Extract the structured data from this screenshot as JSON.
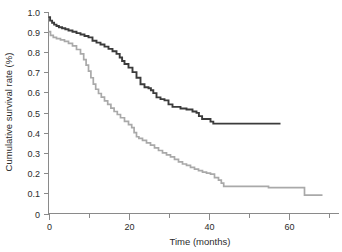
{
  "chart_data": {
    "type": "line",
    "title": "",
    "subtitle": "",
    "xlabel": "Time (months)",
    "ylabel": "Cumulative survival rate (%)",
    "xlim": [
      0,
      72.5
    ],
    "ylim": [
      0,
      1.0
    ],
    "grid": false,
    "legend": "none",
    "xticks": [
      0,
      20,
      40,
      60
    ],
    "xtick_labels": [
      "0",
      "20",
      "40",
      "60"
    ],
    "xminor_ticks": [
      10,
      30,
      50,
      70
    ],
    "yticks": [
      0,
      0.1,
      0.2,
      0.3,
      0.4,
      0.5,
      0.6,
      0.7,
      0.8,
      0.9,
      1.0
    ],
    "ytick_labels": [
      "0",
      "0.1",
      "0.2",
      "0.3",
      "0.4",
      "0.5",
      "0.6",
      "0.7",
      "0.8",
      "0.9",
      "1.0"
    ],
    "annotations": [],
    "series": [
      {
        "name": "upper-curve",
        "style": "step-post",
        "color": "#3b3b3b",
        "width": 1.9,
        "x": [
          0,
          0.4,
          0.9,
          1.4,
          2.0,
          2.6,
          3.4,
          4.2,
          5.0,
          6.0,
          7.0,
          8.0,
          9.0,
          10.0,
          11.0,
          12.0,
          13.0,
          14.0,
          15.0,
          16.0,
          17.0,
          17.8,
          18.4,
          19.0,
          20.0,
          21.0,
          22.0,
          23.0,
          24.0,
          25.0,
          25.6,
          26.2,
          27.0,
          28.0,
          29.0,
          30.0,
          31.0,
          33.0,
          34.5,
          36.0,
          37.0,
          37.6,
          38.4,
          40.5,
          41.2,
          58.0
        ],
        "y": [
          0.972,
          0.955,
          0.944,
          0.935,
          0.928,
          0.922,
          0.917,
          0.912,
          0.906,
          0.9,
          0.893,
          0.886,
          0.879,
          0.872,
          0.855,
          0.846,
          0.837,
          0.826,
          0.815,
          0.803,
          0.79,
          0.772,
          0.755,
          0.74,
          0.722,
          0.7,
          0.672,
          0.64,
          0.625,
          0.62,
          0.61,
          0.596,
          0.575,
          0.566,
          0.56,
          0.54,
          0.528,
          0.52,
          0.515,
          0.505,
          0.498,
          0.482,
          0.468,
          0.455,
          0.445,
          0.445
        ]
      },
      {
        "name": "lower-curve",
        "style": "step-post",
        "color": "#a9a9a9",
        "width": 1.7,
        "x": [
          0,
          0.5,
          1.2,
          2.0,
          3.0,
          4.0,
          5.0,
          6.0,
          7.0,
          8.0,
          8.8,
          9.4,
          10.0,
          10.6,
          11.2,
          11.8,
          12.5,
          13.2,
          14.0,
          14.8,
          15.6,
          16.4,
          17.2,
          18.0,
          19.0,
          20.0,
          20.8,
          21.4,
          22.0,
          22.6,
          23.5,
          24.5,
          25.5,
          26.5,
          27.5,
          28.5,
          29.5,
          30.5,
          31.5,
          32.5,
          33.5,
          34.5,
          35.5,
          36.5,
          37.5,
          38.5,
          39.5,
          40.5,
          41.5,
          42.5,
          43.2,
          43.8,
          54.0,
          55.0,
          63.0,
          64.0,
          68.5
        ],
        "y": [
          0.9,
          0.882,
          0.872,
          0.866,
          0.86,
          0.852,
          0.842,
          0.83,
          0.812,
          0.79,
          0.762,
          0.735,
          0.705,
          0.672,
          0.64,
          0.615,
          0.594,
          0.576,
          0.558,
          0.54,
          0.522,
          0.505,
          0.49,
          0.474,
          0.456,
          0.44,
          0.425,
          0.4,
          0.38,
          0.372,
          0.362,
          0.35,
          0.338,
          0.325,
          0.312,
          0.3,
          0.29,
          0.28,
          0.268,
          0.256,
          0.245,
          0.238,
          0.228,
          0.22,
          0.212,
          0.205,
          0.2,
          0.195,
          0.178,
          0.165,
          0.15,
          0.134,
          0.134,
          0.128,
          0.128,
          0.091,
          0.091
        ]
      }
    ]
  },
  "axes": {
    "y_title": "Cumulative survival rate (%)",
    "x_title": "Time (months)"
  }
}
